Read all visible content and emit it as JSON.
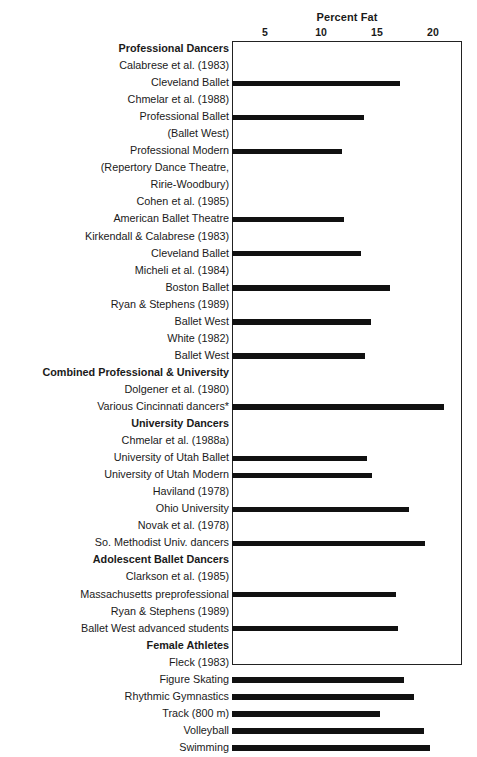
{
  "chart_data": {
    "type": "bar",
    "orientation": "horizontal",
    "title": "Percent Fat",
    "xlabel": "Percent Fat",
    "ylabel": "",
    "grid": false,
    "legend": null,
    "xticks": [
      5,
      10,
      15,
      20
    ],
    "xtick_labels": [
      "5",
      "10",
      "15",
      "20"
    ],
    "xlim": [
      2.05,
      22.6
    ],
    "axis_position": "top",
    "footnote_marker": "*",
    "rows": [
      {
        "label": "Professional Dancers",
        "kind": "group-header",
        "value": null
      },
      {
        "label": "Calabrese et al. (1983)",
        "kind": "citation",
        "value": null
      },
      {
        "label": "Cleveland Ballet",
        "kind": "data",
        "value": 17.1
      },
      {
        "label": "Chmelar et al. (1988)",
        "kind": "citation",
        "value": null
      },
      {
        "label": "Professional Ballet",
        "kind": "data",
        "value": 13.8
      },
      {
        "label": "(Ballet West)",
        "kind": "continuation",
        "value": null
      },
      {
        "label": "Professional Modern",
        "kind": "data",
        "value": 11.9
      },
      {
        "label": "(Repertory Dance Theatre,",
        "kind": "continuation",
        "value": null
      },
      {
        "label": "Ririe-Woodbury)",
        "kind": "continuation",
        "value": null
      },
      {
        "label": "Cohen et al. (1985)",
        "kind": "citation",
        "value": null
      },
      {
        "label": "American Ballet Theatre",
        "kind": "data",
        "value": 12.1
      },
      {
        "label": "Kirkendall & Calabrese (1983)",
        "kind": "citation",
        "value": null
      },
      {
        "label": "Cleveland Ballet",
        "kind": "data",
        "value": 13.6
      },
      {
        "label": "Micheli et al. (1984)",
        "kind": "citation",
        "value": null
      },
      {
        "label": "Boston Ballet",
        "kind": "data",
        "value": 16.2
      },
      {
        "label": "Ryan & Stephens (1989)",
        "kind": "citation",
        "value": null
      },
      {
        "label": "Ballet West",
        "kind": "data",
        "value": 14.5
      },
      {
        "label": "White (1982)",
        "kind": "citation",
        "value": null
      },
      {
        "label": "Ballet West",
        "kind": "data",
        "value": 13.9
      },
      {
        "label": "Combined Professional & University",
        "kind": "group-header",
        "value": null
      },
      {
        "label": "Dolgener et al. (1980)",
        "kind": "citation",
        "value": null
      },
      {
        "label": "Various Cincinnati dancers*",
        "kind": "data",
        "value": 21.0
      },
      {
        "label": "University Dancers",
        "kind": "group-header",
        "value": null
      },
      {
        "label": "Chmelar et al. (1988a)",
        "kind": "citation",
        "value": null
      },
      {
        "label": "University of Utah Ballet",
        "kind": "data",
        "value": 14.1
      },
      {
        "label": "University of Utah Modern",
        "kind": "data",
        "value": 14.6
      },
      {
        "label": "Haviland (1978)",
        "kind": "citation",
        "value": null
      },
      {
        "label": "Ohio University",
        "kind": "data",
        "value": 17.9
      },
      {
        "label": "Novak et al. (1978)",
        "kind": "citation",
        "value": null
      },
      {
        "label": "So. Methodist Univ. dancers",
        "kind": "data",
        "value": 19.3
      },
      {
        "label": "Adolescent Ballet Dancers",
        "kind": "group-header",
        "value": null
      },
      {
        "label": "Clarkson et al. (1985)",
        "kind": "citation",
        "value": null
      },
      {
        "label": "Massachusetts preprofessional",
        "kind": "data",
        "value": 16.7
      },
      {
        "label": "Ryan & Stephens (1989)",
        "kind": "citation",
        "value": null
      },
      {
        "label": "Ballet West advanced students",
        "kind": "data",
        "value": 16.9
      },
      {
        "label": "Female Athletes",
        "kind": "group-header",
        "value": null
      },
      {
        "label": "Fleck (1983)",
        "kind": "citation",
        "value": null
      },
      {
        "label": "Figure Skating",
        "kind": "data",
        "value": 17.4
      },
      {
        "label": "Rhythmic Gymnastics",
        "kind": "data",
        "value": 18.3
      },
      {
        "label": "Track (800 m)",
        "kind": "data",
        "value": 15.3
      },
      {
        "label": "Volleyball",
        "kind": "data",
        "value": 19.2
      },
      {
        "label": "Swimming",
        "kind": "data",
        "value": 19.7
      }
    ]
  },
  "style": {
    "bar_color": "#111111",
    "frame_color": "#222222",
    "text_color": "#1a1a1a",
    "background": "#ffffff"
  }
}
